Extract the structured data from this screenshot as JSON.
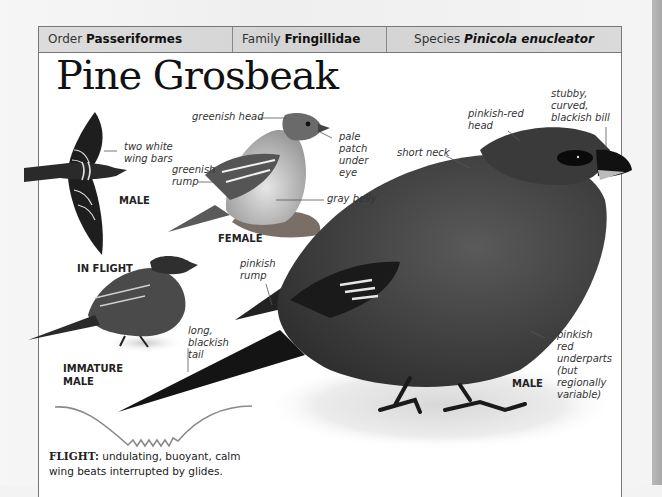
{
  "header": {
    "order_label": "Order",
    "order_value": "Passeriformes",
    "family_label": "Family",
    "family_value": "Fringillidae",
    "species_label": "Species",
    "species_value": "Pinicola enucleator"
  },
  "title": "Pine Grosbeak",
  "figures": {
    "in_flight": {
      "sex_label": "MALE",
      "caption": "IN FLIGHT",
      "annotations": [
        "two white\nwing bars"
      ]
    },
    "female": {
      "caption": "FEMALE",
      "annotations": [
        "greenish head",
        "pale\npatch\nunder\neye",
        "greenish\nrump",
        "gray belly"
      ]
    },
    "immature_male": {
      "caption": "IMMATURE\nMALE"
    },
    "male": {
      "caption": "MALE",
      "annotations": [
        "stubby,\ncurved,\nblackish bill",
        "pinkish-red\nhead",
        "short neck",
        "pinkish\nrump",
        "long,\nblackish\ntail",
        "pinkish\nred\nunderparts\n(but\nregionally\nvariable)"
      ]
    }
  },
  "flight": {
    "heading": "FLIGHT:",
    "description": "undulating, buoyant, calm wing beats interrupted by glides."
  },
  "colors": {
    "panel_border": "#777777",
    "header_bg": "#d8d8d8",
    "text": "#222222",
    "flight_path": "#8a8a8a"
  }
}
